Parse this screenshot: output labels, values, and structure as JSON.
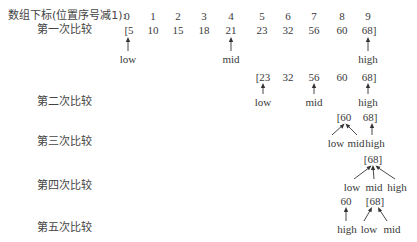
{
  "header": {
    "label": "数组下标(位置序号减1):",
    "indices": [
      "0",
      "1",
      "2",
      "3",
      "4",
      "5",
      "6",
      "7",
      "8",
      "9"
    ]
  },
  "rows": [
    {
      "label": "第一次比较",
      "values": [
        "[5",
        "10",
        "15",
        "18",
        "21",
        "23",
        "32",
        "56",
        "60",
        "68]"
      ],
      "pointers": {
        "low": "low",
        "mid": "mid",
        "high": "high"
      }
    },
    {
      "label": "第二次比较",
      "values": [
        "[23",
        "32",
        "56",
        "60",
        "68]"
      ],
      "pointers": {
        "low": "low",
        "mid": "mid",
        "high": "high"
      }
    },
    {
      "label": "第三次比较",
      "values": [
        "[60",
        "68]"
      ],
      "pointers": {
        "low": "low",
        "mid": "mid",
        "high": "high"
      }
    },
    {
      "label": "第四次比较",
      "values": [
        "[68]"
      ],
      "pointers": {
        "low": "low",
        "mid": "mid",
        "high": "high"
      }
    },
    {
      "label": "第五次比较",
      "values": [
        "60",
        "[68]"
      ],
      "pointers": {
        "high": "high",
        "low": "low",
        "mid": "mid"
      }
    }
  ]
}
